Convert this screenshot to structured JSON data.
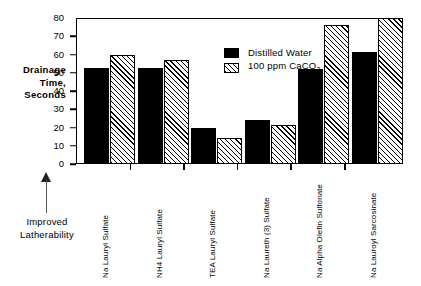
{
  "chart_data": {
    "type": "bar",
    "title": "",
    "xlabel": "",
    "ylabel": "Drainage Time, Seconds",
    "ylabel_lines": [
      "Drainage",
      "Time,",
      "Seconds"
    ],
    "ylim": [
      0,
      80
    ],
    "yticks": [
      0,
      10,
      20,
      30,
      40,
      50,
      60,
      70,
      80
    ],
    "ytick_labels": [
      "0",
      "10",
      "20",
      "30",
      "40",
      "50",
      "60",
      "70",
      "80"
    ],
    "grid": false,
    "legend_position": "upper center",
    "categories": [
      "Na Lauryl Sulfate",
      "NH4 Lauryl Sulfate",
      "TEA Lauryl Sulfate",
      "Na Laureth (3) Sulfate",
      "Na Alpha Olefin Sulfonate",
      "Na Lauroyl Sarcosinate"
    ],
    "series": [
      {
        "name": "Distilled Water",
        "fill": "solid-black",
        "values": [
          52.5,
          52.5,
          20,
          24,
          52,
          61.5
        ]
      },
      {
        "name": "100 ppm CaCO3",
        "name_html": "100 ppm CaCO<sub>3</sub>",
        "fill": "diagonal-hatch",
        "values": [
          60,
          57,
          14.5,
          21.5,
          76,
          80
        ]
      }
    ],
    "annotations": [
      {
        "text": "Improved Latherability",
        "lines": [
          "Improved",
          "Latherability"
        ],
        "arrow": "up"
      }
    ],
    "colors": {
      "series1": "#000000",
      "series2_hatch": "#000000",
      "background": "#ffffff",
      "axis": "#000000"
    }
  },
  "legend": {
    "items": [
      {
        "label": "Distilled Water",
        "swatch": "solid"
      },
      {
        "label": "100 ppm CaCO",
        "sub": "3",
        "swatch": "hatch"
      }
    ]
  },
  "annotation": {
    "line1": "Improved",
    "line2": "Latherability",
    "arrow_icon": "arrow-up-icon"
  }
}
